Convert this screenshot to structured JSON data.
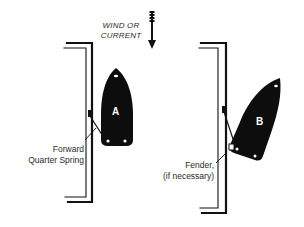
{
  "diagram": {
    "wind_label": [
      "WIND OR",
      "CURRENT"
    ],
    "wind_direction": "down",
    "boats": [
      {
        "id": "A",
        "label": "A",
        "state": "alongside dock"
      },
      {
        "id": "B",
        "label": "B",
        "state": "bow swung out"
      }
    ],
    "annotations": {
      "spring": [
        "Forward",
        "Quarter Spring"
      ],
      "fender": [
        "Fender,",
        "(if necessary)"
      ]
    },
    "colors": {
      "ink": "#111111",
      "background": "#ffffff"
    }
  }
}
